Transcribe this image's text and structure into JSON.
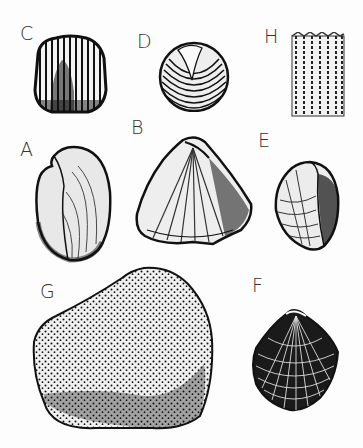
{
  "plate": {
    "title": "Fossil shell illustrations",
    "background": "#ffffff",
    "ink": "#1a1a1a"
  },
  "figures": [
    {
      "label": "C",
      "subject": "ribbed-globular-shell"
    },
    {
      "label": "D",
      "subject": "concentric-ringed-bivalve"
    },
    {
      "label": "H",
      "subject": "columnar-fragment"
    },
    {
      "label": "A",
      "subject": "dotted-ribbed-bivalve-side"
    },
    {
      "label": "B",
      "subject": "triangular-radial-ribbed-shell"
    },
    {
      "label": "E",
      "subject": "cross-hatched-bivalve"
    },
    {
      "label": "G",
      "subject": "stippled-internal-mold"
    },
    {
      "label": "F",
      "subject": "reticulate-bivalve"
    }
  ]
}
